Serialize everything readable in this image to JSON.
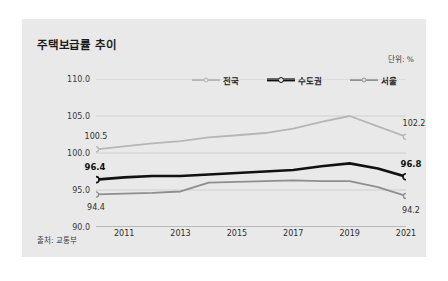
{
  "chart_title": "주택보급률 추이",
  "unit_label": "단위: %",
  "source_label": "출처: 교통부",
  "legend": [
    {
      "label": "전국",
      "color": "#b6b6b6",
      "width": 2.1,
      "marker": "open-circle"
    },
    {
      "label": "수도권",
      "color": "#111111",
      "width": 3.2,
      "marker": "open-circle"
    },
    {
      "label": "서울",
      "color": "#8e8e8e",
      "width": 2.1,
      "marker": "open-circle"
    }
  ],
  "axis": {
    "y_ticks": [
      "110.0",
      "105.0",
      "100.0",
      "95.0",
      "90.0"
    ],
    "x_ticks": [
      "2011",
      "2013",
      "2015",
      "2017",
      "2019",
      "2021"
    ]
  },
  "point_labels": [
    {
      "text": "100.5",
      "series": "전국",
      "side": "left",
      "bold": false
    },
    {
      "text": "102.2",
      "series": "전국",
      "side": "right",
      "bold": false
    },
    {
      "text": "96.4",
      "series": "수도권",
      "side": "left",
      "bold": true
    },
    {
      "text": "96.8",
      "series": "수도권",
      "side": "right",
      "bold": true
    },
    {
      "text": "94.4",
      "series": "서울",
      "side": "left",
      "bold": false
    },
    {
      "text": "94.2",
      "series": "서울",
      "side": "right",
      "bold": false
    }
  ],
  "chart_data": {
    "type": "line",
    "title": "주택보급률 추이",
    "subtitle": "",
    "xlabel": "",
    "ylabel": "",
    "unit": "%",
    "source": "출처: 교통부",
    "x": [
      2010,
      2011,
      2012,
      2013,
      2014,
      2015,
      2016,
      2017,
      2018,
      2019,
      2020,
      2021
    ],
    "xlim": [
      2010,
      2021
    ],
    "ylim": [
      90.0,
      110.0
    ],
    "y_ticks": [
      90.0,
      95.0,
      100.0,
      105.0,
      110.0
    ],
    "x_tick_values": [
      2011,
      2013,
      2015,
      2017,
      2019,
      2021
    ],
    "grid": true,
    "legend_position": "top-center",
    "series": [
      {
        "name": "전국",
        "color": "#b6b6b6",
        "values": [
          100.5,
          100.9,
          101.3,
          101.6,
          102.1,
          102.4,
          102.7,
          103.3,
          104.2,
          105.0,
          103.6,
          102.2
        ],
        "labeled_endpoints": {
          "first": 100.5,
          "last": 102.2
        }
      },
      {
        "name": "수도권",
        "color": "#111111",
        "values": [
          96.4,
          96.7,
          96.9,
          96.9,
          97.1,
          97.3,
          97.5,
          97.7,
          98.2,
          98.6,
          97.9,
          96.8
        ],
        "labeled_endpoints": {
          "first": 96.4,
          "last": 96.8
        }
      },
      {
        "name": "서울",
        "color": "#8e8e8e",
        "values": [
          94.4,
          94.5,
          94.6,
          94.8,
          96.0,
          96.1,
          96.2,
          96.3,
          96.2,
          96.2,
          95.4,
          94.2
        ],
        "labeled_endpoints": {
          "first": 94.4,
          "last": 94.2
        }
      }
    ]
  }
}
